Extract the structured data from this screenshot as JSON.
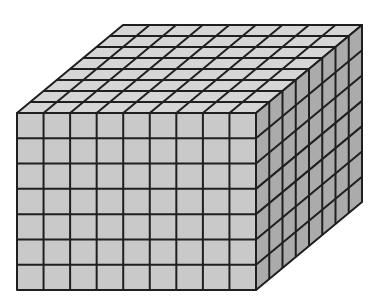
{
  "diagram": {
    "type": "rectangular-prism-unit-cubes",
    "title": "",
    "dimensions": {
      "length": 9,
      "height": 7,
      "depth": 8
    },
    "geometry": {
      "front_left": 17,
      "front_top": 113,
      "front_right": 256,
      "front_bottom": 290,
      "depth_dx": 106,
      "depth_dy": -88
    },
    "colors": {
      "background": "#ffffff",
      "front_face": "#c9c9c9",
      "top_face": "#d6d6d6",
      "side_face": "#ababab",
      "grid_line": "#1f1f1f"
    }
  }
}
